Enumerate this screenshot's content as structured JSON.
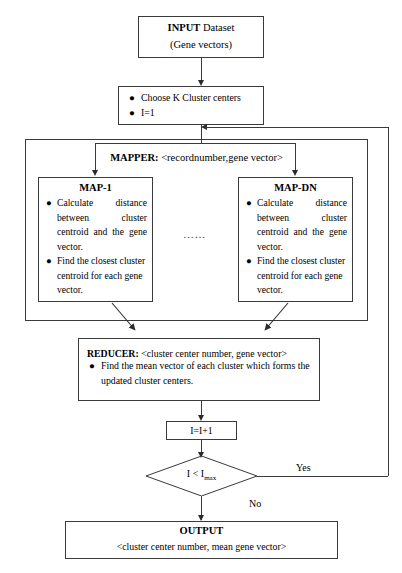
{
  "diagram": {
    "nodes": {
      "input": {
        "line1_bold": "INPUT",
        "line1_rest": " Dataset",
        "line2": "(Gene vectors)"
      },
      "init": {
        "bullet1": "Choose K Cluster centers",
        "bullet2": "I=1"
      },
      "mapper": {
        "label_bold": "MAPPER:",
        "label_rest": " <recordnumber,gene vector>"
      },
      "map1": {
        "title": "MAP-1",
        "bullet1": "Calculate distance between cluster centroid and the gene vector.",
        "bullet2": "Find the closest cluster centroid for each gene vector."
      },
      "mapdn": {
        "title": "MAP-DN",
        "bullet1": "Calculate distance between cluster centroid and the gene vector.",
        "bullet2": "Find the closest cluster centroid for each gene vector."
      },
      "ellipsis": "……",
      "reducer": {
        "label_bold": "REDUCER:",
        "label_rest": " <cluster center number, gene vector>",
        "bullet1": "Find the mean vector of each cluster which forms the updated cluster centers."
      },
      "increment": {
        "text": "I=I+1"
      },
      "decision": {
        "text_pre": "I < I",
        "text_sub": "max"
      },
      "output": {
        "title": "OUTPUT",
        "subtitle": "<cluster center number, mean gene vector>"
      }
    },
    "edges": {
      "yes_label": "Yes",
      "no_label": "No"
    },
    "colors": {
      "stroke": "#3a3a3a",
      "text": "#000000",
      "background": "#ffffff"
    }
  }
}
